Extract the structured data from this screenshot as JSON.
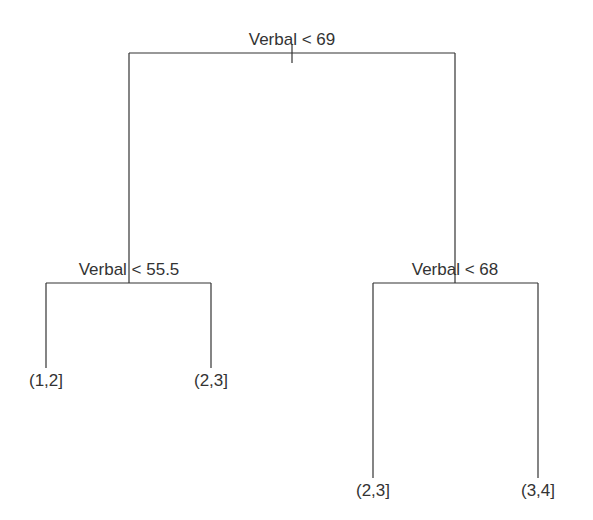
{
  "diagram": {
    "type": "decision-tree",
    "nodes": {
      "root": {
        "label": "Verbal < 69"
      },
      "left": {
        "label": "Verbal < 55.5"
      },
      "right": {
        "label": "Verbal < 68"
      }
    },
    "leaves": {
      "ll": {
        "label": "(1,2]"
      },
      "lr": {
        "label": "(2,3]"
      },
      "rl": {
        "label": "(2,3]"
      },
      "rr": {
        "label": "(3,4]"
      }
    },
    "colors": {
      "line": "#333333",
      "text": "#333333",
      "background": "#ffffff"
    }
  }
}
